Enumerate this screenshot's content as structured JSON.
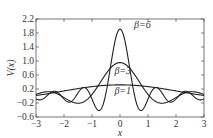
{
  "chart_data": {
    "type": "line",
    "title": "",
    "xlabel": "x",
    "ylabel": "V(x)",
    "xlim": [
      -3,
      3
    ],
    "ylim": [
      -0.6,
      2.2
    ],
    "xticks": [
      "-3",
      "-2",
      "-1",
      "0",
      "1",
      "2",
      "3"
    ],
    "yticks": [
      "2.2",
      "1.8",
      "1.4",
      "1.0",
      "0.6",
      "0.2",
      "-0.2",
      "-0.6"
    ],
    "grid": false,
    "legend": "inline annotations",
    "formula": "V(x) = sin(beta*x)/(pi*x)",
    "series": [
      {
        "name": "β=6",
        "beta": 6,
        "peak": 1.91,
        "label_pos": [
          0.5,
          1.95
        ]
      },
      {
        "name": "β=3",
        "beta": 3,
        "peak": 0.95,
        "label_pos": [
          -0.2,
          0.62
        ]
      },
      {
        "name": "β=1",
        "beta": 1,
        "peak": 0.32,
        "label_pos": [
          -0.2,
          0.05
        ]
      }
    ],
    "annotations": [
      "β=6",
      "β=3",
      "β=1"
    ]
  }
}
